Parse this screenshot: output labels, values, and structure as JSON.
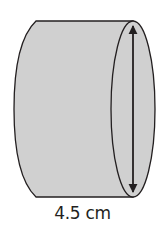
{
  "diagram": {
    "shape": "cylinder",
    "orientation": "horizontal (lying on side)",
    "measurement": {
      "label": "4.5 cm",
      "value": 4.5,
      "unit": "cm",
      "dimension": "diameter",
      "indicator": "double-headed-arrow"
    },
    "colors": {
      "fill": "#d0d0d0",
      "outline": "#231f20",
      "background": "#ffffff"
    }
  }
}
